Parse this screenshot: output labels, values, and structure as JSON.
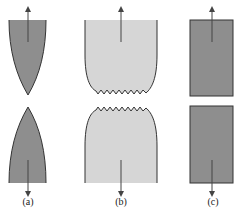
{
  "figure": {
    "panels": [
      {
        "id": "a",
        "label": "(a)",
        "description": "Brittle-ductile pointed (cup-less) fracture: necking to a point",
        "fill": "#8e8e8e"
      },
      {
        "id": "b",
        "label": "(b)",
        "description": "Ductile fracture with necking and jagged surface",
        "fill": "#d6d6d6"
      },
      {
        "id": "c",
        "label": "(c)",
        "description": "Brittle fracture with flat surfaces",
        "fill": "#8e8e8e"
      }
    ],
    "colors": {
      "outline": "#333333",
      "arrow": "#444444",
      "background": "#ffffff"
    }
  }
}
